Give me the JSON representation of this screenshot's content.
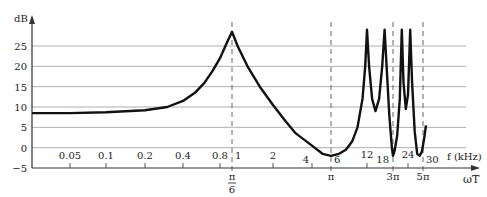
{
  "chart_data": {
    "type": "line",
    "title": "",
    "ylabel": "dB",
    "xlabel_top": "f (kHz)",
    "xlabel_bottom": "ωT",
    "ylim": [
      -5,
      29
    ],
    "yticks": [
      25,
      20,
      15,
      10,
      5,
      0,
      -5
    ],
    "ytick_labels": [
      "25",
      "20",
      "15",
      "10",
      "5",
      "0",
      "−5"
    ],
    "grid": true,
    "x_scale": "log (frequency), approximate",
    "f_ticks": [
      {
        "label": "0.05",
        "f": 0.05
      },
      {
        "label": "0.1",
        "f": 0.1
      },
      {
        "label": "0.2",
        "f": 0.2
      },
      {
        "label": "0.4",
        "f": 0.4
      },
      {
        "label": "0.8",
        "f": 0.8
      },
      {
        "label": "1",
        "f": 1
      },
      {
        "label": "2",
        "f": 2
      },
      {
        "label": "4",
        "f": 4
      },
      {
        "label": "6",
        "f": 6
      },
      {
        "label": "12",
        "f": 12
      },
      {
        "label": "18",
        "f": 18
      },
      {
        "label": "24",
        "f": 24
      },
      {
        "label": "30",
        "f": 30
      }
    ],
    "omega_ticks": [
      {
        "label_num": "π",
        "label_den": "6",
        "f": 1
      },
      {
        "label_num": "π",
        "label_den": "",
        "f": 6
      },
      {
        "label_num": "3π",
        "label_den": "",
        "f": 18
      },
      {
        "label_num": "5π",
        "label_den": "",
        "f": 30
      }
    ],
    "dashed_markers_f": [
      1,
      6,
      18,
      30
    ],
    "series": [
      {
        "name": "magnitude response",
        "points": [
          [
            0.02,
            8.5
          ],
          [
            0.05,
            8.5
          ],
          [
            0.1,
            8.7
          ],
          [
            0.2,
            9.2
          ],
          [
            0.3,
            10
          ],
          [
            0.4,
            11.5
          ],
          [
            0.5,
            13.5
          ],
          [
            0.6,
            16
          ],
          [
            0.7,
            19
          ],
          [
            0.8,
            22
          ],
          [
            0.9,
            25.5
          ],
          [
            1.0,
            28.5
          ],
          [
            1.1,
            25
          ],
          [
            1.3,
            20
          ],
          [
            1.6,
            15
          ],
          [
            2.0,
            10.5
          ],
          [
            2.5,
            6.5
          ],
          [
            3.0,
            3.5
          ],
          [
            4.0,
            0.5
          ],
          [
            5.0,
            -1.5
          ],
          [
            6.0,
            -2
          ],
          [
            7.0,
            -1.5
          ],
          [
            8.0,
            -0.5
          ],
          [
            9.0,
            1.5
          ],
          [
            10.0,
            5
          ],
          [
            11.0,
            12
          ],
          [
            11.6,
            20
          ],
          [
            12.0,
            29
          ],
          [
            12.4,
            20
          ],
          [
            13.0,
            12
          ],
          [
            13.7,
            9
          ],
          [
            14.5,
            12
          ],
          [
            15.2,
            20
          ],
          [
            15.8,
            29
          ],
          [
            16.3,
            20
          ],
          [
            17.0,
            8
          ],
          [
            17.7,
            0
          ],
          [
            18.0,
            -2
          ],
          [
            18.5,
            -1
          ],
          [
            19.5,
            3
          ],
          [
            20.5,
            12
          ],
          [
            21.3,
            29
          ],
          [
            22.0,
            16
          ],
          [
            23.0,
            9.5
          ],
          [
            24.0,
            13
          ],
          [
            24.8,
            29
          ],
          [
            25.5,
            16
          ],
          [
            26.5,
            4
          ],
          [
            27.5,
            -1.5
          ],
          [
            28.5,
            -2
          ],
          [
            29.5,
            -1
          ],
          [
            30.5,
            2
          ],
          [
            31.5,
            5.5
          ]
        ]
      }
    ]
  }
}
